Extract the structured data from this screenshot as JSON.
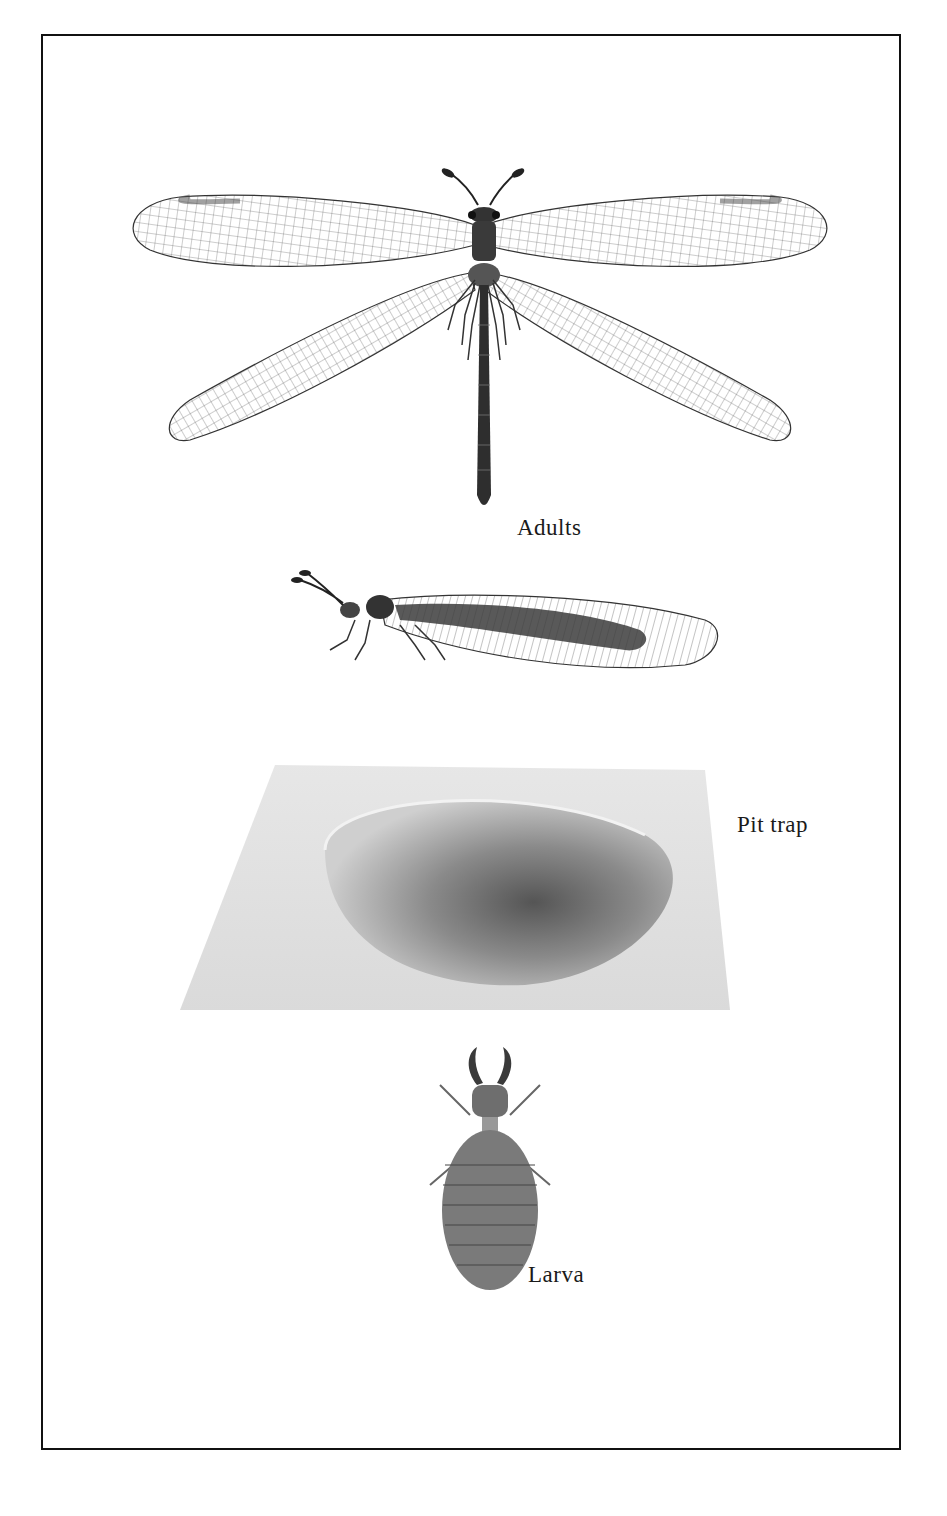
{
  "plate": {
    "figures": [
      {
        "id": "adult-dorsal",
        "description": "Adult antlion, dorsal view with wings spread",
        "label": "Adults"
      },
      {
        "id": "adult-lateral",
        "description": "Adult antlion, side view at rest with wings folded",
        "label": ""
      },
      {
        "id": "pit-trap",
        "description": "Conical pit trap in sand",
        "label": "Pit trap"
      },
      {
        "id": "larva",
        "description": "Antlion larva, dorsal view",
        "label": "Larva"
      }
    ]
  },
  "colors": {
    "frame": "#111111",
    "ink": "#2a2a2a",
    "sand": "#cfcfcf",
    "pit": "#6a6a6a",
    "background": "#ffffff"
  }
}
